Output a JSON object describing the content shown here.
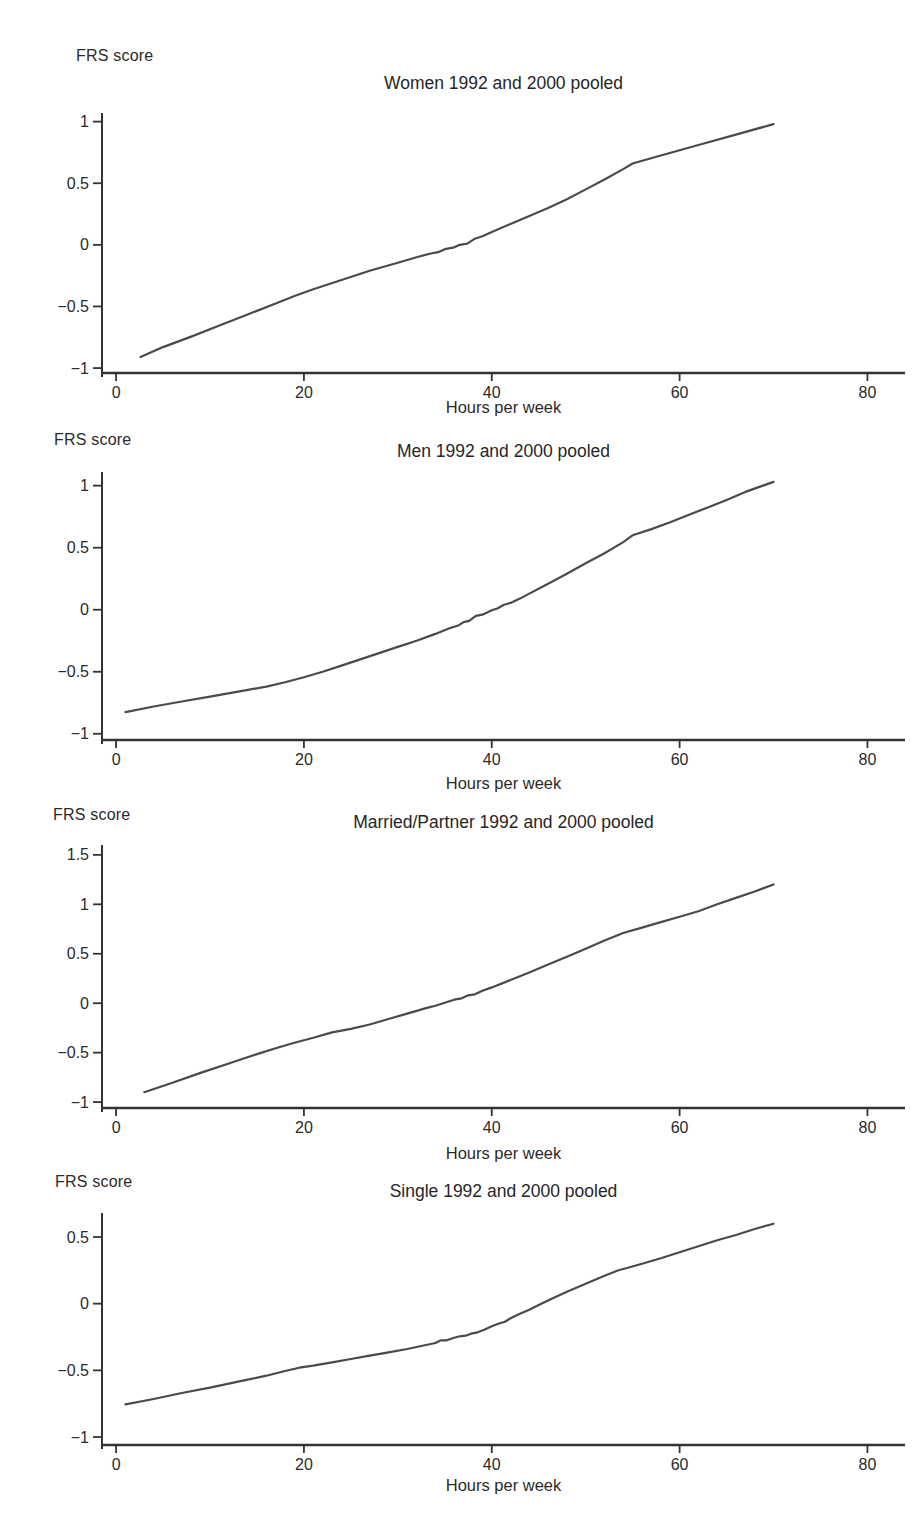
{
  "figure": {
    "ylabel": "FRS score",
    "xlabel": "Hours per week"
  },
  "chart_data": [
    {
      "type": "line",
      "title": "Women 1992 and 2000 pooled",
      "ylabel": "FRS score",
      "xlabel": "Hours per week",
      "x_ticks": [
        0,
        20,
        40,
        60,
        80
      ],
      "y_ticks": [
        -1,
        -0.5,
        0,
        0.5,
        1
      ],
      "xlim": [
        -1.5,
        84
      ],
      "ylim": [
        -1.04,
        1.07
      ],
      "grid": false,
      "legend": null,
      "line_color": "#4a4a4a",
      "points": [
        [
          2.6,
          -0.91
        ],
        [
          5,
          -0.83
        ],
        [
          8,
          -0.745
        ],
        [
          11,
          -0.655
        ],
        [
          14,
          -0.565
        ],
        [
          17,
          -0.475
        ],
        [
          19,
          -0.415
        ],
        [
          21,
          -0.36
        ],
        [
          24,
          -0.285
        ],
        [
          27,
          -0.21
        ],
        [
          30,
          -0.145
        ],
        [
          32,
          -0.1
        ],
        [
          33.5,
          -0.07
        ],
        [
          34.3,
          -0.06
        ],
        [
          35,
          -0.035
        ],
        [
          36,
          -0.02
        ],
        [
          36.6,
          0.0
        ],
        [
          37.4,
          0.01
        ],
        [
          38.2,
          0.05
        ],
        [
          39,
          0.07
        ],
        [
          40,
          0.105
        ],
        [
          42,
          0.17
        ],
        [
          44,
          0.235
        ],
        [
          46,
          0.3
        ],
        [
          48,
          0.37
        ],
        [
          50,
          0.45
        ],
        [
          52,
          0.53
        ],
        [
          54,
          0.615
        ],
        [
          55,
          0.66
        ],
        [
          58,
          0.725
        ],
        [
          62,
          0.81
        ],
        [
          66,
          0.895
        ],
        [
          70,
          0.98
        ]
      ]
    },
    {
      "type": "line",
      "title": "Men 1992 and 2000 pooled",
      "ylabel": "FRS score",
      "xlabel": "Hours per week",
      "x_ticks": [
        0,
        20,
        40,
        60,
        80
      ],
      "y_ticks": [
        -1,
        -0.5,
        0,
        0.5,
        1
      ],
      "xlim": [
        -1.5,
        84
      ],
      "ylim": [
        -1.05,
        1.11
      ],
      "grid": false,
      "legend": null,
      "line_color": "#4a4a4a",
      "points": [
        [
          1,
          -0.825
        ],
        [
          4,
          -0.78
        ],
        [
          7,
          -0.74
        ],
        [
          10,
          -0.7
        ],
        [
          13,
          -0.66
        ],
        [
          16,
          -0.62
        ],
        [
          18,
          -0.585
        ],
        [
          20,
          -0.545
        ],
        [
          22,
          -0.5
        ],
        [
          24,
          -0.45
        ],
        [
          26,
          -0.4
        ],
        [
          28,
          -0.35
        ],
        [
          30,
          -0.3
        ],
        [
          32,
          -0.25
        ],
        [
          34,
          -0.195
        ],
        [
          35.5,
          -0.15
        ],
        [
          36.5,
          -0.125
        ],
        [
          37,
          -0.1
        ],
        [
          37.6,
          -0.09
        ],
        [
          38.3,
          -0.05
        ],
        [
          39,
          -0.04
        ],
        [
          40,
          -0.005
        ],
        [
          40.6,
          0.01
        ],
        [
          41.3,
          0.04
        ],
        [
          42,
          0.055
        ],
        [
          43,
          0.09
        ],
        [
          44,
          0.13
        ],
        [
          46,
          0.21
        ],
        [
          48,
          0.29
        ],
        [
          50,
          0.375
        ],
        [
          52,
          0.455
        ],
        [
          54,
          0.545
        ],
        [
          55,
          0.6
        ],
        [
          57,
          0.65
        ],
        [
          59,
          0.705
        ],
        [
          61,
          0.765
        ],
        [
          63,
          0.825
        ],
        [
          65,
          0.885
        ],
        [
          67,
          0.95
        ],
        [
          70,
          1.03
        ]
      ]
    },
    {
      "type": "line",
      "title": "Married/Partner 1992 and 2000 pooled",
      "ylabel": "FRS score",
      "xlabel": "Hours per week",
      "x_ticks": [
        0,
        20,
        40,
        60,
        80
      ],
      "y_ticks": [
        -1,
        -0.5,
        0,
        0.5,
        1,
        1.5
      ],
      "xlim": [
        -1.5,
        84
      ],
      "ylim": [
        -1.06,
        1.6
      ],
      "grid": false,
      "legend": null,
      "line_color": "#4a4a4a",
      "points": [
        [
          3,
          -0.9
        ],
        [
          6,
          -0.805
        ],
        [
          9,
          -0.705
        ],
        [
          12,
          -0.61
        ],
        [
          15,
          -0.515
        ],
        [
          17,
          -0.455
        ],
        [
          19,
          -0.4
        ],
        [
          21,
          -0.35
        ],
        [
          23,
          -0.295
        ],
        [
          25,
          -0.26
        ],
        [
          27,
          -0.215
        ],
        [
          29,
          -0.16
        ],
        [
          31,
          -0.105
        ],
        [
          33,
          -0.05
        ],
        [
          34,
          -0.025
        ],
        [
          35,
          0.005
        ],
        [
          36,
          0.035
        ],
        [
          36.8,
          0.05
        ],
        [
          37.5,
          0.08
        ],
        [
          38.2,
          0.09
        ],
        [
          39,
          0.125
        ],
        [
          40,
          0.16
        ],
        [
          42,
          0.235
        ],
        [
          44,
          0.31
        ],
        [
          46,
          0.39
        ],
        [
          48,
          0.47
        ],
        [
          50,
          0.55
        ],
        [
          52,
          0.635
        ],
        [
          54,
          0.71
        ],
        [
          56,
          0.765
        ],
        [
          58,
          0.82
        ],
        [
          60,
          0.875
        ],
        [
          62,
          0.93
        ],
        [
          64,
          1.0
        ],
        [
          66,
          1.065
        ],
        [
          68,
          1.13
        ],
        [
          70,
          1.2
        ]
      ]
    },
    {
      "type": "line",
      "title": "Single 1992 and 2000 pooled",
      "ylabel": "FRS score",
      "xlabel": "Hours per week",
      "x_ticks": [
        0,
        20,
        40,
        60,
        80
      ],
      "y_ticks": [
        -1,
        -0.5,
        0,
        0.5
      ],
      "xlim": [
        -1.5,
        84
      ],
      "ylim": [
        -1.06,
        0.68
      ],
      "grid": false,
      "legend": null,
      "line_color": "#4a4a4a",
      "points": [
        [
          1,
          -0.755
        ],
        [
          4,
          -0.715
        ],
        [
          7,
          -0.67
        ],
        [
          10,
          -0.63
        ],
        [
          13,
          -0.585
        ],
        [
          16,
          -0.54
        ],
        [
          18,
          -0.505
        ],
        [
          19.5,
          -0.48
        ],
        [
          21,
          -0.465
        ],
        [
          23,
          -0.44
        ],
        [
          25,
          -0.415
        ],
        [
          27,
          -0.39
        ],
        [
          29,
          -0.365
        ],
        [
          31,
          -0.34
        ],
        [
          33,
          -0.31
        ],
        [
          34,
          -0.295
        ],
        [
          34.6,
          -0.275
        ],
        [
          35.2,
          -0.275
        ],
        [
          36,
          -0.255
        ],
        [
          36.6,
          -0.245
        ],
        [
          37.2,
          -0.24
        ],
        [
          37.8,
          -0.225
        ],
        [
          38.5,
          -0.215
        ],
        [
          39.2,
          -0.195
        ],
        [
          40,
          -0.17
        ],
        [
          40.7,
          -0.15
        ],
        [
          41.4,
          -0.135
        ],
        [
          42.1,
          -0.105
        ],
        [
          43,
          -0.075
        ],
        [
          44,
          -0.045
        ],
        [
          45,
          -0.01
        ],
        [
          46.5,
          0.04
        ],
        [
          48,
          0.09
        ],
        [
          50,
          0.15
        ],
        [
          52,
          0.21
        ],
        [
          53.5,
          0.25
        ],
        [
          54.5,
          0.27
        ],
        [
          56,
          0.3
        ],
        [
          58,
          0.34
        ],
        [
          60,
          0.385
        ],
        [
          62,
          0.43
        ],
        [
          64,
          0.475
        ],
        [
          66,
          0.515
        ],
        [
          68,
          0.56
        ],
        [
          70,
          0.6
        ]
      ]
    }
  ]
}
